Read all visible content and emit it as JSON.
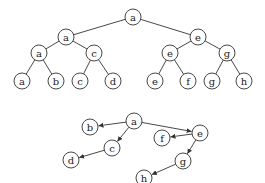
{
  "diagram": {
    "node_radius": 8,
    "colors": {
      "stroke": "#333333",
      "fill": "#ffffff",
      "text": "#222222"
    },
    "tree": {
      "nodes": [
        {
          "id": "t0",
          "label": "a",
          "x": 133,
          "y": 17
        },
        {
          "id": "t1",
          "label": "a",
          "x": 66,
          "y": 37
        },
        {
          "id": "t2",
          "label": "e",
          "x": 198,
          "y": 37
        },
        {
          "id": "t3",
          "label": "a",
          "x": 39,
          "y": 53
        },
        {
          "id": "t4",
          "label": "c",
          "x": 94,
          "y": 53
        },
        {
          "id": "t5",
          "label": "e",
          "x": 170,
          "y": 53
        },
        {
          "id": "t6",
          "label": "g",
          "x": 227,
          "y": 53
        },
        {
          "id": "t7",
          "label": "a",
          "x": 22,
          "y": 81
        },
        {
          "id": "t8",
          "label": "b",
          "x": 56,
          "y": 81
        },
        {
          "id": "t9",
          "label": "c",
          "x": 80,
          "y": 81
        },
        {
          "id": "t10",
          "label": "d",
          "x": 113,
          "y": 81
        },
        {
          "id": "t11",
          "label": "e",
          "x": 155,
          "y": 81
        },
        {
          "id": "t12",
          "label": "f",
          "x": 188,
          "y": 81
        },
        {
          "id": "t13",
          "label": "g",
          "x": 212,
          "y": 81
        },
        {
          "id": "t14",
          "label": "h",
          "x": 244,
          "y": 81
        }
      ],
      "edges": [
        [
          "t0",
          "t1"
        ],
        [
          "t0",
          "t2"
        ],
        [
          "t1",
          "t3"
        ],
        [
          "t1",
          "t4"
        ],
        [
          "t2",
          "t5"
        ],
        [
          "t2",
          "t6"
        ],
        [
          "t3",
          "t7"
        ],
        [
          "t3",
          "t8"
        ],
        [
          "t4",
          "t9"
        ],
        [
          "t4",
          "t10"
        ],
        [
          "t5",
          "t11"
        ],
        [
          "t5",
          "t12"
        ],
        [
          "t6",
          "t13"
        ],
        [
          "t6",
          "t14"
        ]
      ]
    },
    "graph": {
      "nodes": [
        {
          "id": "g_a",
          "label": "a",
          "x": 134,
          "y": 121
        },
        {
          "id": "g_b",
          "label": "b",
          "x": 90,
          "y": 127
        },
        {
          "id": "g_c",
          "label": "c",
          "x": 112,
          "y": 148
        },
        {
          "id": "g_d",
          "label": "d",
          "x": 71,
          "y": 160
        },
        {
          "id": "g_e",
          "label": "e",
          "x": 200,
          "y": 133
        },
        {
          "id": "g_f",
          "label": "f",
          "x": 162,
          "y": 138
        },
        {
          "id": "g_g",
          "label": "g",
          "x": 183,
          "y": 161
        },
        {
          "id": "g_h",
          "label": "h",
          "x": 144,
          "y": 178
        }
      ],
      "arrows": [
        [
          "g_a",
          "g_b"
        ],
        [
          "g_a",
          "g_c"
        ],
        [
          "g_c",
          "g_d"
        ],
        [
          "g_a",
          "g_e"
        ],
        [
          "g_e",
          "g_f"
        ],
        [
          "g_e",
          "g_g"
        ],
        [
          "g_g",
          "g_h"
        ]
      ]
    }
  }
}
